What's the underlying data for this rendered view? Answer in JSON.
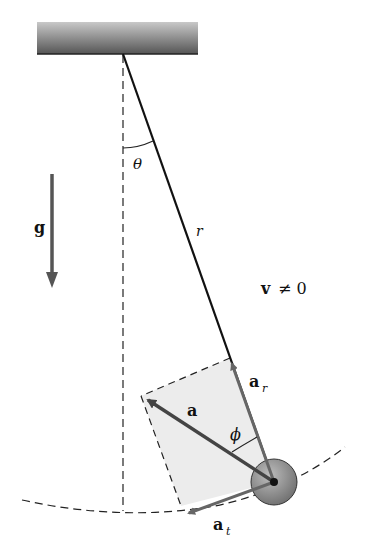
{
  "diagram": {
    "type": "physics-pendulum",
    "labels": {
      "theta": "θ",
      "gravity": "g",
      "length": "r",
      "velocity_v": "v",
      "velocity_condition": "≠ 0",
      "accel_total": "a",
      "accel_radial": "a",
      "accel_radial_sub": "r",
      "accel_tangential": "a",
      "accel_tangential_sub": "t",
      "phi": "ϕ"
    },
    "colors": {
      "string": "#111111",
      "vector": "#666666",
      "accel_main": "#444444",
      "rect_fill": "#ececec",
      "bob": "#8a8a8a",
      "ceiling": "#7a7a7a"
    }
  }
}
